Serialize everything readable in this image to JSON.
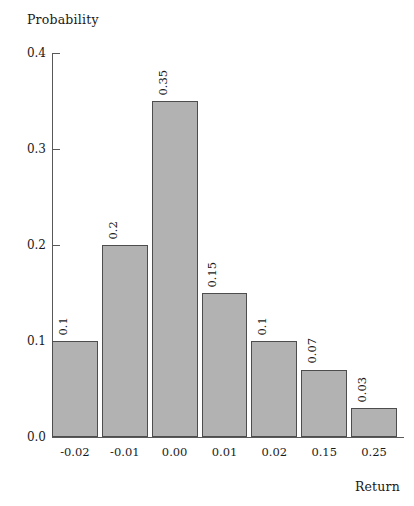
{
  "chart_data": {
    "type": "bar",
    "title": "",
    "xlabel": "Return",
    "ylabel": "Probability",
    "categories": [
      "-0.02",
      "-0.01",
      "0.00",
      "0.01",
      "0.02",
      "0.15",
      "0.25"
    ],
    "values": [
      0.1,
      0.2,
      0.35,
      0.15,
      0.1,
      0.07,
      0.03
    ],
    "value_labels": [
      "0.1",
      "0.2",
      "0.35",
      "0.15",
      "0.1",
      "0.07",
      "0.03"
    ],
    "ylim": [
      0.0,
      0.4
    ],
    "ytick_labels": [
      "0.4",
      "0.3",
      "0.2",
      "0.1",
      "0.0"
    ],
    "ytick_values": [
      0.4,
      0.3,
      0.2,
      0.1,
      0.0
    ],
    "grid": false,
    "legend": false,
    "bar_color": "#b2b2b2",
    "bar_border_color": "#4d4d4d",
    "axis_color": "#595959",
    "background": "#ffffff",
    "value_label_rotation": 90
  }
}
